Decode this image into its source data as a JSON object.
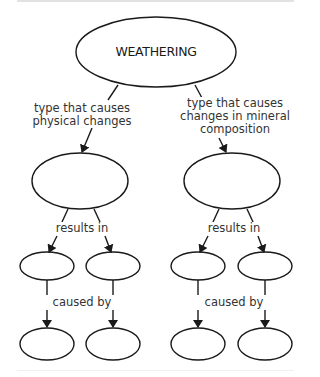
{
  "diagram": {
    "type": "concept-map",
    "root": {
      "id": "weathering",
      "label": "WEATHERING"
    },
    "branches": [
      {
        "link_label_lines": [
          "type that causes",
          "physical changes"
        ],
        "node": {
          "label": ""
        },
        "results_in_label": "results in",
        "results": [
          {
            "label": ""
          },
          {
            "label": ""
          }
        ],
        "caused_by_label": "caused by",
        "causes": [
          {
            "label": ""
          },
          {
            "label": ""
          }
        ]
      },
      {
        "link_label_lines": [
          "type that causes",
          "changes in mineral",
          "composition"
        ],
        "node": {
          "label": ""
        },
        "results_in_label": "results in",
        "results": [
          {
            "label": ""
          },
          {
            "label": ""
          }
        ],
        "caused_by_label": "caused by",
        "causes": [
          {
            "label": ""
          },
          {
            "label": ""
          }
        ]
      }
    ]
  },
  "colors": {
    "stroke": "#1a1a1a",
    "text": "#333333",
    "background": "#ffffff"
  }
}
